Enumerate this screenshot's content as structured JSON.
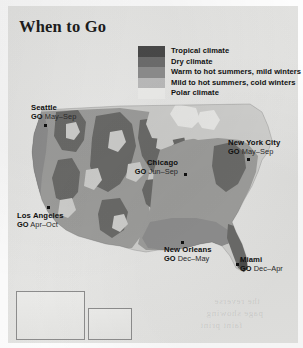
{
  "page": {
    "title": "When to Go",
    "map_type": "climate-zone-map",
    "region": "United States"
  },
  "legend": {
    "items": [
      {
        "label": "Tropical climate",
        "color": "#4a4a4a"
      },
      {
        "label": "Dry climate",
        "color": "#6e6e6e"
      },
      {
        "label": "Warm to hot summers, mild winters",
        "color": "#8e8e8e"
      },
      {
        "label": "Mild to hot summers, cold winters",
        "color": "#bdbdbd"
      },
      {
        "label": "Polar climate",
        "color": "#efefed"
      }
    ]
  },
  "cities": [
    {
      "name": "Seattle",
      "go_prefix": "GO",
      "months": "May–Sep"
    },
    {
      "name": "Los Angeles",
      "go_prefix": "GO",
      "months": "Apr–Oct"
    },
    {
      "name": "Chicago",
      "go_prefix": "GO",
      "months": "Jun–Sep"
    },
    {
      "name": "New York City",
      "go_prefix": "GO",
      "months": "May–Sep"
    },
    {
      "name": "New Orleans",
      "go_prefix": "GO",
      "months": "Dec–May"
    },
    {
      "name": "Miami",
      "go_prefix": "GO",
      "months": "Dec–Apr"
    }
  ],
  "insets": [
    {
      "name": "Alaska"
    },
    {
      "name": "Hawaii"
    }
  ],
  "colors": {
    "paper": "#fdfdfd",
    "panel": "#e9e9e7",
    "ink": "#111111",
    "water": "#e9e9e7",
    "land_light": "#cfcfcd",
    "land_mid": "#9e9e9c",
    "land_dark": "#6b6b69",
    "land_darkest": "#4c4c4a"
  },
  "bleed_text": [
    "the reverse",
    "page showing",
    "faint print"
  ]
}
